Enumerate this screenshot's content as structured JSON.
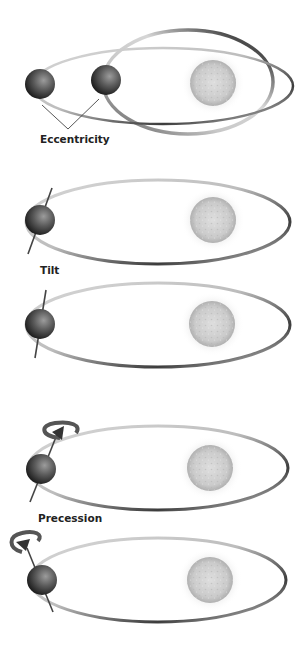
{
  "diagram": {
    "panels": [
      {
        "id": "eccentricity",
        "label": "Eccentricity",
        "label_pos": [
          40,
          131
        ],
        "show_label": true
      },
      {
        "id": "tilt-1",
        "label": "Tilt",
        "label_pos": [
          40,
          263
        ],
        "show_label": true
      },
      {
        "id": "tilt-2",
        "label": "",
        "show_label": false
      },
      {
        "id": "precession-1",
        "label": "Precession",
        "label_pos": [
          38,
          511
        ],
        "show_label": true
      },
      {
        "id": "precession-2",
        "label": "",
        "show_label": false
      }
    ],
    "colors": {
      "background": "#ffffff",
      "orbit_dark": "#4a4a4a",
      "orbit_light": "#e6e6e6",
      "planet_dark": "#1e1e1e",
      "planet_light": "#8a8a8a",
      "sun_fill": "#d2d2d2",
      "label": "#222222"
    }
  }
}
